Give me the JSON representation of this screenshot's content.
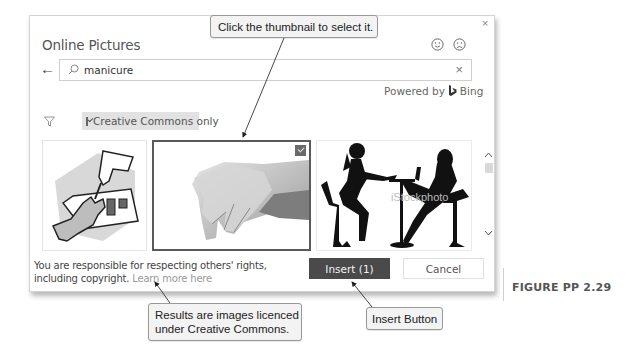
{
  "dialog": {
    "title": "Online Pictures",
    "close_icon": "×",
    "feedback": {
      "smile_icon": "smiley-face",
      "frown_icon": "frowning-face"
    },
    "back_icon": "←",
    "search": {
      "value": "manicure",
      "placeholder": "",
      "clear_icon": "×"
    },
    "powered_by": {
      "label": "Powered by",
      "brand": "Bing",
      "brand_glyph": "b"
    },
    "filter": {
      "icon": "filter-icon",
      "chip_label": "Creative Commons only",
      "checked": true
    },
    "thumbnails": [
      {
        "description": "clip art of hands applying nail polish",
        "selected": false
      },
      {
        "description": "photo of manicured hands",
        "selected": true
      },
      {
        "description": "silhouette of manicurist and client at table",
        "selected": false,
        "watermark": "iStockphoto"
      }
    ],
    "scrollbar": {
      "up_icon": "^",
      "down_icon": "v"
    },
    "footer": {
      "notice": "You are responsible for respecting others' rights, including copyright.",
      "learn_more": "Learn more here"
    },
    "buttons": {
      "insert": "Insert (1)",
      "cancel": "Cancel"
    }
  },
  "callouts": {
    "thumbnail": "Click the thumbnail to select it.",
    "creative_commons_line1": "Results are images licenced",
    "creative_commons_line2": "under Creative Commons.",
    "insert": "Insert Button"
  },
  "figure_label": "FIGURE PP 2.29",
  "colors": {
    "insert_button_bg": "#4a4a4a",
    "chip_bg": "#e2e2e2",
    "callout_bg": "#f3f3f3",
    "selected_border": "#5a5a5a"
  }
}
